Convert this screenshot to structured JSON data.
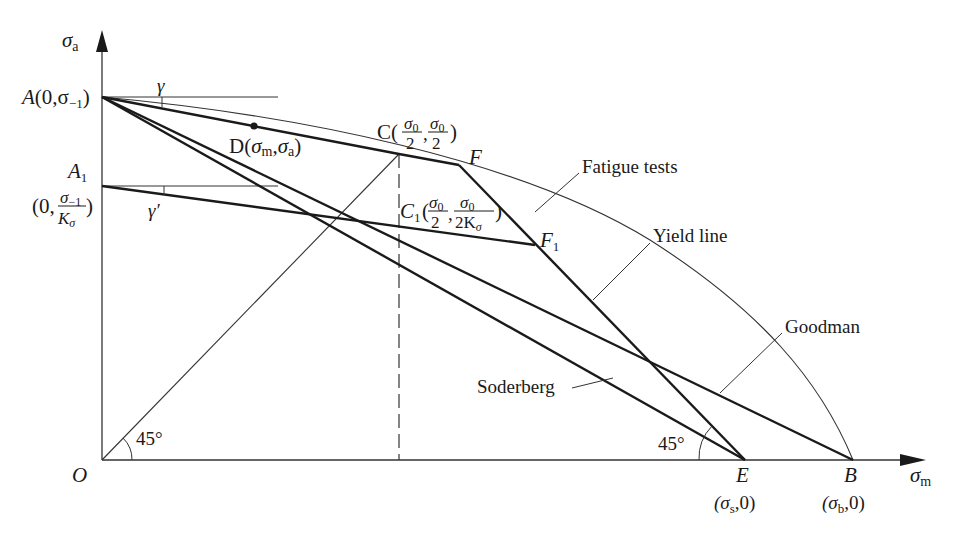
{
  "diagram": {
    "type": "fatigue-limit-stress-diagram",
    "axes": {
      "y_label": "σ",
      "y_label_sub": "a",
      "x_label": "σ",
      "x_label_sub": "m",
      "origin_label": "O"
    },
    "points": {
      "A": {
        "name": "A",
        "coord": "(0,σ",
        "coord_sub": "−1",
        "coord_end": ")"
      },
      "A1": {
        "name": "A",
        "name_sub": "1",
        "coord_open": "(0,",
        "frac_num": "σ",
        "frac_num_sub": "−1",
        "frac_den": "K",
        "frac_den_sub": "σ",
        "coord_close": ")"
      },
      "C": {
        "name": "C(",
        "frac1_num": "σ",
        "frac1_num_sub": "0",
        "frac1_den": "2",
        "sep": ",",
        "frac2_num": "σ",
        "frac2_num_sub": "0",
        "frac2_den": "2",
        "close": ")"
      },
      "C1": {
        "name": "C",
        "name_sub": "1",
        "open": "(",
        "frac1_num": "σ",
        "frac1_num_sub": "0",
        "frac1_den": "2",
        "sep": ",",
        "frac2_num": "σ",
        "frac2_num_sub": "0",
        "frac2_den": "2K",
        "frac2_den_sub": "σ",
        "close": ")"
      },
      "D": {
        "name": "D(",
        "s1": "σ",
        "s1_sub": "m",
        "sep": ",",
        "s2": "σ",
        "s2_sub": "a",
        "close": ")"
      },
      "F": {
        "name": "F"
      },
      "F1": {
        "name": "F",
        "name_sub": "1"
      },
      "E": {
        "name": "E",
        "coord_open": "(σ",
        "coord_sub": "s",
        "coord_close": ",0)"
      },
      "B": {
        "name": "B",
        "coord_open": "(σ",
        "coord_sub": "b",
        "coord_close": ",0)"
      }
    },
    "angles": {
      "gamma": "γ",
      "gamma_prime": "γ′",
      "origin_angle": "45°",
      "e_angle": "45°"
    },
    "curve_labels": {
      "fatigue_tests": "Fatigue tests",
      "yield_line": "Yield line",
      "goodman": "Goodman",
      "soderberg": "Soderberg"
    }
  }
}
